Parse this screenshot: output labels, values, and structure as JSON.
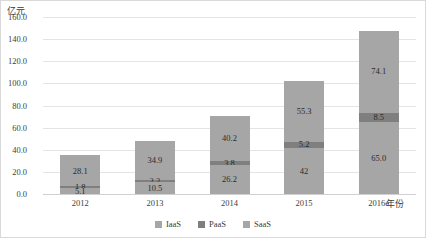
{
  "chart_data": {
    "type": "bar",
    "subtype": "stacked-column",
    "title": "",
    "xlabel": "年份",
    "ylabel": "亿元",
    "categories": [
      "2012",
      "2013",
      "2014",
      "2015",
      "2016e"
    ],
    "series": [
      {
        "name": "IaaS",
        "values": [
          5.1,
          10.5,
          26.2,
          42,
          65.0
        ],
        "labels": [
          "5.1",
          "10.5",
          "26.2",
          "42",
          "65.0"
        ],
        "color": "#a6a6a6"
      },
      {
        "name": "PaaS",
        "values": [
          1.8,
          2.2,
          3.8,
          5.2,
          8.5
        ],
        "labels": [
          "1.8",
          "2.2",
          "3.8",
          "5.2",
          "8.5"
        ],
        "color": "#7f7f7f"
      },
      {
        "name": "SaaS",
        "values": [
          28.1,
          34.9,
          40.2,
          55.3,
          74.1
        ],
        "labels": [
          "28.1",
          "34.9",
          "40.2",
          "55.3",
          "74.1"
        ],
        "color": "#a6a6a6"
      }
    ],
    "totals": [
      35.0,
      47.6,
      70.2,
      102.5,
      147.6
    ],
    "ylim": [
      0,
      160
    ],
    "yticks": [
      "0.0",
      "20.0",
      "40.0",
      "60.0",
      "80.0",
      "100.0",
      "120.0",
      "140.0",
      "160.0"
    ],
    "ytick_values": [
      0,
      20,
      40,
      60,
      80,
      100,
      120,
      140,
      160
    ],
    "grid": true,
    "legend_position": "bottom",
    "legend": [
      "IaaS",
      "PaaS",
      "SaaS"
    ]
  },
  "axes": {
    "y_title": "亿元",
    "x_title": "年份"
  },
  "colors": {
    "series_light": "#a6a6a6",
    "series_dark": "#7f7f7f",
    "gridline": "#e4e4e4",
    "border": "#d9d9d9",
    "text": "#404040"
  }
}
